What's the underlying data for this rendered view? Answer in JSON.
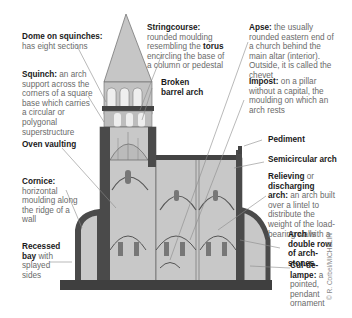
{
  "labels": {
    "dome": {
      "term": "Dome on squinches:",
      "desc": "has eight sections"
    },
    "squinch": {
      "term": "Squinch:",
      "desc": " an arch support across the corners of a square base which carries a circular or polygonal superstructure"
    },
    "oven": {
      "term": "Oven vaulting"
    },
    "cornice": {
      "term": "Cornice:",
      "desc": "horizontal moulding along the ridge of a wall"
    },
    "recessed": {
      "term": "Recessed bay",
      "desc": " with splayed sides"
    },
    "stringcourse": {
      "term": "Stringcourse:",
      "desc": " rounded moulding resembling the ",
      "term2": "torus",
      "desc2": " encircling the base of a column or pedestal"
    },
    "broken": {
      "term": "Broken barrel arch"
    },
    "apse": {
      "term": "Apse:",
      "desc": " the usually rounded eastern end of a church behind the main altar (interior). Outside, it is called the chevet"
    },
    "impost": {
      "term": "Impost:",
      "desc": " on a pillar without a capital, the moulding on which an arch rests"
    },
    "pediment": {
      "term": "Pediment"
    },
    "semicircular": {
      "term": "Semicircular arch"
    },
    "relieving": {
      "term": "Relieving",
      "mid": " or ",
      "term2": "discharging arch:",
      "desc": " an arch built over a lintel to distribute the weight of the load-bearing walls"
    },
    "double": {
      "term": "Arch",
      "mid": " with a ",
      "term2": "double row of arch-stones"
    },
    "cul": {
      "term": "Cul-de-lampe:",
      "desc": " a pointed, pendant ornament"
    }
  },
  "credit": "© R. Corbel/MICHELIN",
  "colors": {
    "wall": "#4a4a4a",
    "fill": "#c8c8c8",
    "line": "#8a8a8a"
  }
}
